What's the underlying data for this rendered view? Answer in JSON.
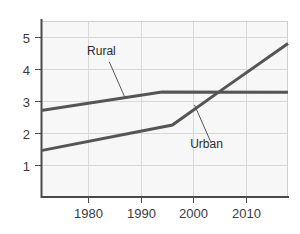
{
  "chart_data": {
    "type": "line",
    "title": "",
    "subtitle": "",
    "xlabel": "",
    "ylabel": "",
    "xlim": [
      1971,
      2018
    ],
    "ylim": [
      0,
      5.5
    ],
    "xticks": [
      1980,
      1990,
      2000,
      2010
    ],
    "xtick_labels": [
      "1980",
      "1990",
      "2000",
      "2010"
    ],
    "yticks": [
      1,
      2,
      3,
      4,
      5
    ],
    "ytick_labels": [
      "1",
      "2",
      "3",
      "4",
      "5"
    ],
    "grid": true,
    "grid_axis": "both",
    "legend": "none",
    "plot_background": "#f7f7f7",
    "grid_color": "#d8d8d8",
    "axis_color": "#4a4a4a",
    "series": [
      {
        "name": "Rural",
        "color": "#555555",
        "x": [
          1971,
          1994,
          2018
        ],
        "values": [
          2.7,
          3.28,
          3.27
        ]
      },
      {
        "name": "Urban",
        "color": "#555555",
        "x": [
          1971,
          1996,
          2005,
          2018
        ],
        "values": [
          1.45,
          2.25,
          3.3,
          4.8
        ]
      }
    ],
    "annotations": [
      {
        "text": "Rural",
        "label_x": 1982.5,
        "label_y": 4.45,
        "leader_from_x": 1984.0,
        "leader_from_y": 4.22,
        "leader_to_x": 1987.0,
        "leader_to_y": 3.1
      },
      {
        "text": "Urban",
        "label_x": 2002.5,
        "label_y": 1.52,
        "leader_from_x": 2003.3,
        "leader_from_y": 1.72,
        "leader_to_x": 2000.2,
        "leader_to_y": 2.88
      }
    ]
  }
}
